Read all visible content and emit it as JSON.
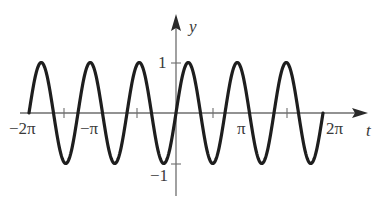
{
  "chart_data": {
    "type": "line",
    "function": "sin(3t)",
    "title": "",
    "xlabel": "t",
    "ylabel": "y",
    "x_range": [
      -6.2832,
      6.2832
    ],
    "ylim": [
      -1,
      1
    ],
    "grid": false,
    "legend": null,
    "x_tick_labels": [
      "-2π",
      "-π",
      "π",
      "2π"
    ],
    "y_tick_labels": [
      "1",
      "-1"
    ],
    "x_tick_marks": [
      "-3π/2",
      "-π/2",
      "π/2",
      "3π/2"
    ],
    "series": [
      {
        "name": "y = sin(3t)",
        "color": "#1e1e1e",
        "amplitude": 1,
        "frequency": 3,
        "period": "2π/3",
        "sample_points": [
          {
            "t": "-2π",
            "y": 0
          },
          {
            "t": "-11π/6",
            "y": 1
          },
          {
            "t": "-3π/2",
            "y": -1
          },
          {
            "t": "-7π/6",
            "y": 1
          },
          {
            "t": "-5π/6",
            "y": -1
          },
          {
            "t": "-π/2",
            "y": 1
          },
          {
            "t": "-π/6",
            "y": -1
          },
          {
            "t": "0",
            "y": 0
          },
          {
            "t": "π/6",
            "y": 1
          },
          {
            "t": "π/2",
            "y": -1
          },
          {
            "t": "5π/6",
            "y": 1
          },
          {
            "t": "7π/6",
            "y": -1
          },
          {
            "t": "3π/2",
            "y": 1
          },
          {
            "t": "11π/6",
            "y": -1
          },
          {
            "t": "2π",
            "y": 0
          }
        ]
      }
    ]
  },
  "labels": {
    "x_axis": "t",
    "y_axis": "y",
    "neg_two_pi": "−2π",
    "neg_pi": "−π",
    "pi": "π",
    "two_pi": "2π",
    "one": "1",
    "neg_one": "−1"
  },
  "colors": {
    "axis": "#6e6e6e",
    "curve": "#1e1e1e",
    "text": "#3a3a3a"
  }
}
